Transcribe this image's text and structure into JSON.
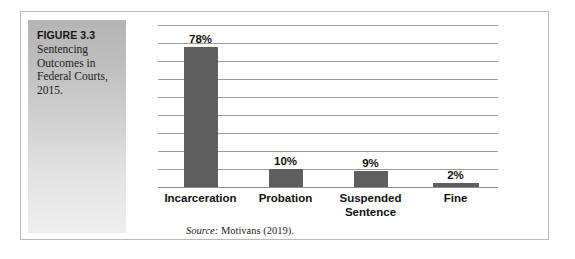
{
  "figure": {
    "number_label": "FIGURE 3.3",
    "caption": "Sentencing Outcomes in Federal Courts, 2015.",
    "source_label": "Source:",
    "source_text": "Motivans (2019)."
  },
  "colors": {
    "bar": "#5e5e5e",
    "gridline": "#9a9a9a",
    "panel_top": "#b4b4b4",
    "panel_bottom": "#efefef",
    "border": "#b9b9b9"
  },
  "chart_data": {
    "type": "bar",
    "title": "Sentencing Outcomes in Federal Courts, 2015.",
    "xlabel": "",
    "ylabel": "",
    "ylim": [
      0,
      90
    ],
    "grid": true,
    "legend": "none",
    "gridline_interval": 10,
    "gridline_count": 9,
    "categories": [
      "Incarceration",
      "Probation",
      "Suspended Sentence",
      "Fine"
    ],
    "values": [
      78,
      10,
      9,
      2
    ],
    "data_labels": [
      "78%",
      "10%",
      "9%",
      "2%"
    ],
    "source": "Source: Motivans (2019)."
  },
  "bars": [
    {
      "label": "Incarceration",
      "label_line2": "",
      "value_text": "78%",
      "value": 78
    },
    {
      "label": "Probation",
      "label_line2": "",
      "value_text": "10%",
      "value": 10
    },
    {
      "label": "Suspended",
      "label_line2": "Sentence",
      "value_text": "9%",
      "value": 9
    },
    {
      "label": "Fine",
      "label_line2": "",
      "value_text": "2%",
      "value": 2
    }
  ]
}
